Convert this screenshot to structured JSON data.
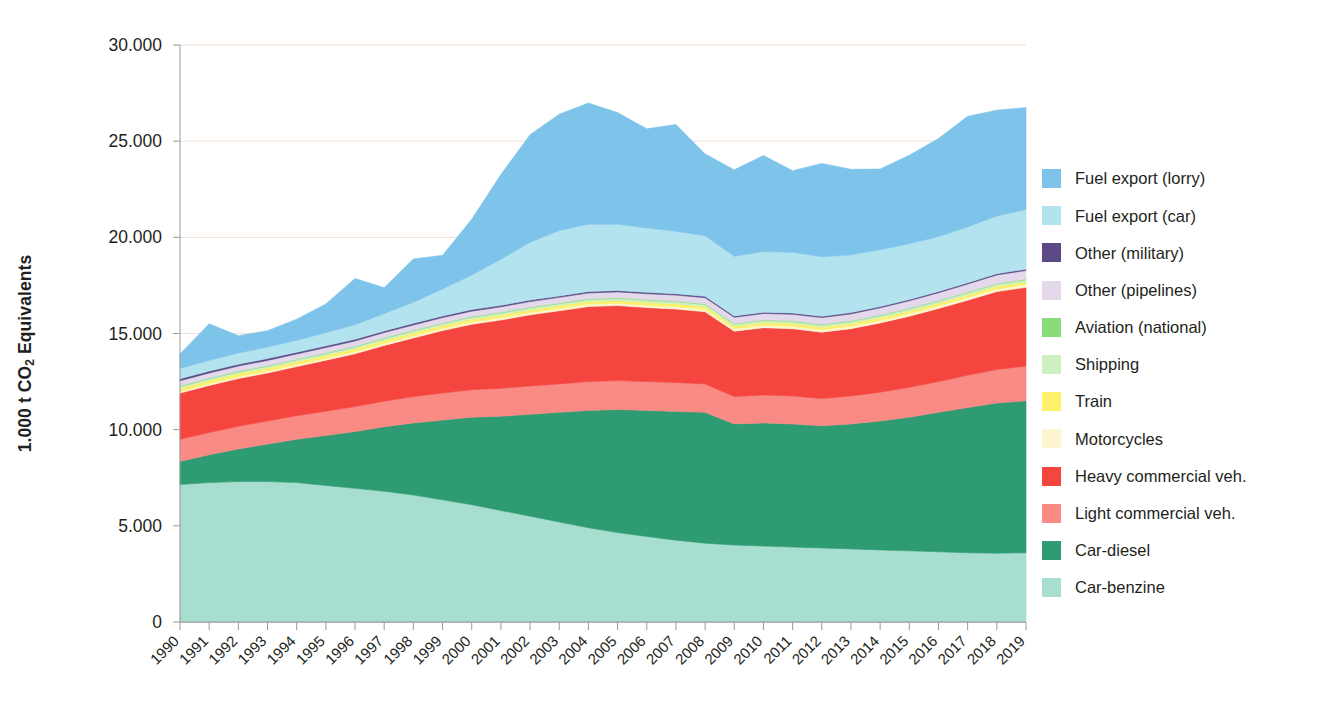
{
  "chart_data": {
    "type": "area",
    "stacked": true,
    "title": "",
    "xlabel": "",
    "ylabel": "1.000 t CO2 Equivalents",
    "ylabel_parts": {
      "pre": "1.000 t CO",
      "sub": "2",
      "post": " Equivalents"
    },
    "ylim": [
      0,
      30000
    ],
    "yticks": [
      0,
      5000,
      10000,
      15000,
      20000,
      25000,
      30000
    ],
    "ytick_labels": [
      "0",
      "5.000",
      "10.000",
      "15.000",
      "20.000",
      "25.000",
      "30.000"
    ],
    "grid": true,
    "grid_color": "#f5ded2",
    "legend_position": "right",
    "categories": [
      "1990",
      "1991",
      "1992",
      "1993",
      "1994",
      "1995",
      "1996",
      "1997",
      "1998",
      "1999",
      "2000",
      "2001",
      "2002",
      "2003",
      "2004",
      "2005",
      "2006",
      "2007",
      "2008",
      "2009",
      "2010",
      "2011",
      "2012",
      "2013",
      "2014",
      "2015",
      "2016",
      "2017",
      "2018",
      "2019"
    ],
    "stack_order_bottom_to_top": [
      "Car-benzine",
      "Car-diesel",
      "Light commercial veh.",
      "Heavy commercial veh.",
      "Motorcycles",
      "Train",
      "Shipping",
      "Aviation (national)",
      "Other (pipelines)",
      "Other (military)",
      "Fuel export (car)",
      "Fuel export (lorry)"
    ],
    "series": [
      {
        "name": "Car-benzine",
        "color": "#a8ded0",
        "values": [
          7150,
          7250,
          7300,
          7300,
          7250,
          7100,
          6950,
          6800,
          6600,
          6350,
          6100,
          5800,
          5500,
          5200,
          4900,
          4650,
          4450,
          4250,
          4100,
          4000,
          3950,
          3900,
          3850,
          3800,
          3750,
          3700,
          3650,
          3600,
          3580,
          3600
        ]
      },
      {
        "name": "Car-diesel",
        "color": "#2e9b72",
        "values": [
          1200,
          1450,
          1700,
          1950,
          2250,
          2600,
          2950,
          3350,
          3750,
          4150,
          4550,
          4900,
          5300,
          5700,
          6100,
          6400,
          6550,
          6700,
          6800,
          6300,
          6400,
          6400,
          6350,
          6500,
          6700,
          6950,
          7250,
          7550,
          7800,
          7900
        ]
      },
      {
        "name": "Light commercial veh.",
        "color": "#f98a84",
        "values": [
          1150,
          1150,
          1180,
          1200,
          1230,
          1260,
          1300,
          1330,
          1370,
          1400,
          1430,
          1450,
          1470,
          1480,
          1500,
          1500,
          1500,
          1500,
          1480,
          1420,
          1450,
          1450,
          1420,
          1450,
          1500,
          1550,
          1600,
          1680,
          1750,
          1800
        ]
      },
      {
        "name": "Heavy commercial veh.",
        "color": "#f4453f",
        "values": [
          2400,
          2450,
          2480,
          2500,
          2550,
          2650,
          2750,
          2900,
          3050,
          3250,
          3400,
          3550,
          3700,
          3800,
          3900,
          3900,
          3850,
          3820,
          3750,
          3400,
          3500,
          3500,
          3450,
          3500,
          3600,
          3700,
          3800,
          3900,
          4050,
          4100
        ]
      },
      {
        "name": "Motorcycles",
        "color": "#fcf5d0",
        "values": [
          90,
          92,
          94,
          96,
          98,
          100,
          102,
          105,
          108,
          110,
          112,
          114,
          116,
          118,
          120,
          122,
          124,
          126,
          128,
          125,
          127,
          128,
          128,
          130,
          132,
          134,
          136,
          138,
          140,
          142
        ]
      },
      {
        "name": "Train",
        "color": "#fdf06a",
        "values": [
          160,
          158,
          156,
          154,
          152,
          150,
          150,
          150,
          150,
          150,
          148,
          146,
          146,
          145,
          145,
          144,
          143,
          142,
          142,
          138,
          140,
          140,
          138,
          138,
          138,
          138,
          138,
          138,
          138,
          138
        ]
      },
      {
        "name": "Shipping",
        "color": "#cdf0c0",
        "values": [
          95,
          96,
          97,
          98,
          99,
          100,
          101,
          102,
          103,
          104,
          105,
          106,
          107,
          108,
          109,
          110,
          110,
          110,
          110,
          105,
          106,
          106,
          105,
          106,
          107,
          108,
          109,
          110,
          111,
          112
        ]
      },
      {
        "name": "Aviation (national)",
        "color": "#88dd7a",
        "values": [
          38,
          38,
          38,
          38,
          38,
          38,
          38,
          38,
          38,
          38,
          38,
          38,
          38,
          38,
          38,
          38,
          38,
          38,
          38,
          36,
          36,
          36,
          36,
          36,
          36,
          36,
          36,
          36,
          36,
          36
        ]
      },
      {
        "name": "Other (pipelines)",
        "color": "#e3d9ea",
        "values": [
          260,
          262,
          264,
          266,
          268,
          270,
          272,
          274,
          276,
          278,
          280,
          282,
          285,
          290,
          295,
          300,
          305,
          310,
          315,
          320,
          330,
          340,
          350,
          360,
          370,
          385,
          400,
          420,
          440,
          450
        ]
      },
      {
        "name": "Other (military)",
        "color": "#5b4a86",
        "values": [
          100,
          98,
          96,
          94,
          92,
          90,
          88,
          86,
          84,
          82,
          80,
          78,
          76,
          74,
          72,
          70,
          70,
          70,
          70,
          68,
          68,
          68,
          68,
          68,
          68,
          68,
          68,
          68,
          68,
          68
        ]
      },
      {
        "name": "Fuel export (car)",
        "color": "#b3e3ef",
        "values": [
          540,
          560,
          580,
          600,
          620,
          680,
          760,
          900,
          1100,
          1400,
          1800,
          2400,
          3000,
          3400,
          3500,
          3450,
          3350,
          3250,
          3150,
          3100,
          3150,
          3150,
          3100,
          3000,
          2950,
          2900,
          2850,
          2900,
          3000,
          3100
        ]
      },
      {
        "name": "Fuel export (lorry)",
        "color": "#7ec3ea",
        "values": [
          750,
          1900,
          900,
          850,
          1100,
          1500,
          2400,
          1350,
          2250,
          1750,
          2900,
          4400,
          5600,
          6050,
          6300,
          5800,
          5150,
          5550,
          4250,
          4500,
          5000,
          4250,
          4850,
          4450,
          4200,
          4600,
          5100,
          5750,
          5500,
          5300
        ]
      }
    ],
    "legend_entries": [
      {
        "label": "Fuel export (lorry)",
        "color": "#7ec3ea"
      },
      {
        "label": "Fuel export (car)",
        "color": "#b3e3ef"
      },
      {
        "label": "Other (military)",
        "color": "#5b4a86"
      },
      {
        "label": "Other (pipelines)",
        "color": "#e3d9ea"
      },
      {
        "label": "Aviation (national)",
        "color": "#88dd7a"
      },
      {
        "label": "Shipping",
        "color": "#cdf0c0"
      },
      {
        "label": "Train",
        "color": "#fdf06a"
      },
      {
        "label": "Motorcycles",
        "color": "#fcf5d0"
      },
      {
        "label": "Heavy commercial veh.",
        "color": "#f4453f"
      },
      {
        "label": "Light commercial veh.",
        "color": "#f98a84"
      },
      {
        "label": "Car-diesel",
        "color": "#2e9b72"
      },
      {
        "label": "Car-benzine",
        "color": "#a8ded0"
      }
    ]
  }
}
